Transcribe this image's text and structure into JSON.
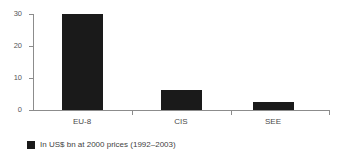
{
  "chart_data": {
    "type": "bar",
    "title": "",
    "subtitle": "",
    "xlabel": "",
    "ylabel": "",
    "categories": [
      "EU-8",
      "CIS",
      "SEE"
    ],
    "values": [
      30,
      6.2,
      2.5
    ],
    "series": [
      {
        "name": "In US$ bn at 2000 prices (1992–2003)",
        "values": [
          30,
          6.2,
          2.5
        ]
      }
    ],
    "ylim": [
      0,
      30
    ],
    "yticks": [
      0,
      10,
      20,
      30
    ],
    "ytick_labels": [
      "0",
      "10",
      "20",
      "30"
    ],
    "grid": false,
    "legend_position": "bottom-left",
    "legend_entries": [
      "In US$ bn at 2000 prices (1992–2003)"
    ],
    "bar_color": "#1a1a1a",
    "axis_color": "#8c8c8c",
    "background_color": "#ffffff"
  },
  "axis": {
    "y": {
      "ticks": [
        {
          "label": "30",
          "value": 30
        },
        {
          "label": "20",
          "value": 20
        },
        {
          "label": "10",
          "value": 10
        },
        {
          "label": "0",
          "value": 0
        }
      ]
    },
    "x": {
      "ticks": [
        {
          "label": "EU-8"
        },
        {
          "label": "CIS"
        },
        {
          "label": "SEE"
        }
      ]
    }
  },
  "legend": {
    "items": [
      {
        "label": "In US$ bn at 2000 prices (1992–2003)",
        "color": "#1a1a1a"
      }
    ]
  }
}
